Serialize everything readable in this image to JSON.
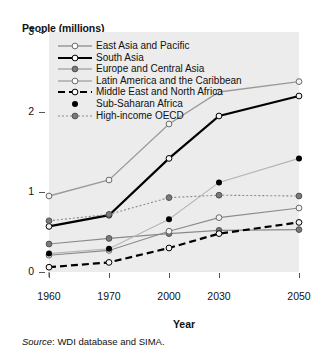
{
  "figure": {
    "y_axis_title": "People (millions)",
    "x_axis_title": "Year",
    "source_prefix": "Source",
    "source_text": ": WDI database and SIMA."
  },
  "axes": {
    "y_ticks": [
      "0",
      "1",
      "2",
      "3"
    ],
    "x_ticks": [
      "1960",
      "1970",
      "2000",
      "2030",
      "2050"
    ]
  },
  "legend": {
    "items": [
      {
        "label": "East Asia and Pacific",
        "color": "#9a9a9a",
        "marker": "open",
        "dash": "solid"
      },
      {
        "label": "South Asia",
        "color": "#000000",
        "marker": "open",
        "dash": "solid"
      },
      {
        "label": "Europe and Central Asia",
        "color": "#8a8a8a",
        "marker": "filled-gray",
        "dash": "solid"
      },
      {
        "label": "Latin America and the Caribbean",
        "color": "#8a8a8a",
        "marker": "open",
        "dash": "solid"
      },
      {
        "label": "Middle East and North Africa",
        "color": "#000000",
        "marker": "open",
        "dash": "dashed"
      },
      {
        "label": "Sub-Saharan Africa",
        "color": "#b5b5b5",
        "marker": "filled-black",
        "dash": "solid"
      },
      {
        "label": "High-income OECD",
        "color": "#8a8a8a",
        "marker": "filled-gray",
        "dash": "dotted"
      }
    ]
  },
  "chart_data": {
    "type": "line",
    "title": "",
    "xlabel": "Year",
    "ylabel": "People (millions)",
    "x": [
      "1960",
      "1970",
      "2000",
      "2030",
      "2050"
    ],
    "ylim": [
      0,
      3
    ],
    "yticks": [
      0,
      1,
      2,
      3
    ],
    "grid": false,
    "legend_position": "inside-top-left",
    "series": [
      {
        "name": "East Asia and Pacific",
        "values": [
          0.95,
          1.15,
          1.85,
          2.25,
          2.38
        ]
      },
      {
        "name": "South Asia",
        "values": [
          0.57,
          0.71,
          1.42,
          1.95,
          2.2
        ]
      },
      {
        "name": "Europe and Central Asia",
        "values": [
          0.35,
          0.42,
          0.48,
          0.52,
          0.53
        ]
      },
      {
        "name": "Latin America and the Caribbean",
        "values": [
          0.21,
          0.27,
          0.51,
          0.68,
          0.8
        ]
      },
      {
        "name": "Middle East and North Africa",
        "values": [
          0.06,
          0.12,
          0.3,
          0.48,
          0.62
        ]
      },
      {
        "name": "Sub-Saharan Africa",
        "values": [
          0.23,
          0.29,
          0.66,
          1.12,
          1.42
        ]
      },
      {
        "name": "High-income OECD",
        "values": [
          0.64,
          0.72,
          0.93,
          0.96,
          0.95
        ]
      }
    ]
  }
}
